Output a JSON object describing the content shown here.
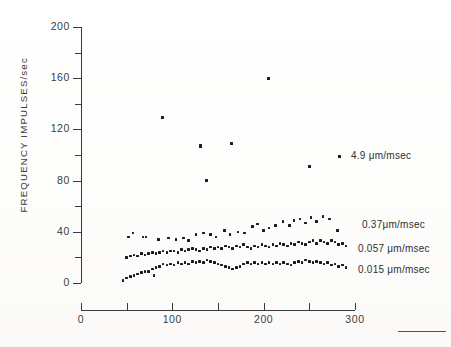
{
  "axes": {
    "y": {
      "title": "FREQUENCY  IMPULSES/sec",
      "labels": [
        "200",
        "160",
        "120",
        "80",
        "40",
        "0"
      ],
      "label_values": [
        200,
        160,
        120,
        80,
        40,
        0
      ],
      "tick_values": [
        0,
        20,
        40,
        60,
        80,
        100,
        120,
        140,
        160,
        180,
        200
      ],
      "range": [
        0,
        200
      ]
    },
    "x": {
      "title": "",
      "labels": [
        "0",
        "100",
        "200",
        "300"
      ],
      "label_values": [
        0,
        100,
        200,
        300
      ],
      "tick_values": [
        0,
        50,
        100,
        150,
        200,
        250,
        300
      ],
      "range": [
        0,
        300
      ]
    }
  },
  "legend": [
    {
      "label": "4.9 μm/msec",
      "marker": true
    },
    {
      "label": "0.37μm/msec",
      "marker": false
    },
    {
      "label": "0.057 μm/msec",
      "marker": false
    },
    {
      "label": "0.015 μm/msec",
      "marker": false
    }
  ],
  "chart_data": {
    "type": "scatter",
    "title": "",
    "xlabel": "",
    "ylabel": "FREQUENCY IMPULSES/sec",
    "xlim": [
      0,
      300
    ],
    "ylim": [
      0,
      200
    ],
    "grid": false,
    "legend_position": "right",
    "marker_color": "#1a1a1a",
    "series": [
      {
        "name": "4.9 μm/msec",
        "points": [
          [
            89,
            129
          ],
          [
            131,
            107
          ],
          [
            137,
            80
          ],
          [
            165,
            109
          ],
          [
            205,
            160
          ],
          [
            250,
            91
          ]
        ]
      },
      {
        "name": "0.37 μm/msec",
        "points": [
          [
            52,
            36
          ],
          [
            57,
            39
          ],
          [
            68,
            36
          ],
          [
            71,
            36
          ],
          [
            85,
            34
          ],
          [
            96,
            35
          ],
          [
            104,
            34
          ],
          [
            112,
            35
          ],
          [
            118,
            33
          ],
          [
            126,
            38
          ],
          [
            134,
            39
          ],
          [
            142,
            38
          ],
          [
            148,
            36
          ],
          [
            157,
            41
          ],
          [
            163,
            38
          ],
          [
            172,
            40
          ],
          [
            179,
            39
          ],
          [
            188,
            44
          ],
          [
            193,
            46
          ],
          [
            200,
            41
          ],
          [
            206,
            43
          ],
          [
            213,
            45
          ],
          [
            221,
            48
          ],
          [
            228,
            45
          ],
          [
            233,
            49
          ],
          [
            240,
            50
          ],
          [
            246,
            47
          ],
          [
            252,
            51
          ],
          [
            258,
            48
          ],
          [
            265,
            52
          ],
          [
            272,
            50
          ],
          [
            281,
            41
          ]
        ]
      },
      {
        "name": "0.057 μm/msec",
        "points": [
          [
            50,
            20
          ],
          [
            54,
            21
          ],
          [
            58,
            22
          ],
          [
            62,
            21
          ],
          [
            66,
            23
          ],
          [
            70,
            22
          ],
          [
            74,
            23
          ],
          [
            78,
            24
          ],
          [
            82,
            23
          ],
          [
            86,
            24
          ],
          [
            90,
            25
          ],
          [
            94,
            24
          ],
          [
            98,
            25
          ],
          [
            102,
            25
          ],
          [
            106,
            24
          ],
          [
            110,
            26
          ],
          [
            114,
            25
          ],
          [
            118,
            26
          ],
          [
            122,
            27
          ],
          [
            126,
            26
          ],
          [
            130,
            25
          ],
          [
            134,
            27
          ],
          [
            138,
            26
          ],
          [
            142,
            28
          ],
          [
            146,
            27
          ],
          [
            150,
            28
          ],
          [
            154,
            27
          ],
          [
            158,
            29
          ],
          [
            162,
            28
          ],
          [
            166,
            27
          ],
          [
            170,
            29
          ],
          [
            174,
            28
          ],
          [
            178,
            30
          ],
          [
            182,
            28
          ],
          [
            186,
            27
          ],
          [
            190,
            29
          ],
          [
            194,
            28
          ],
          [
            198,
            30
          ],
          [
            202,
            29
          ],
          [
            206,
            28
          ],
          [
            210,
            30
          ],
          [
            214,
            29
          ],
          [
            218,
            31
          ],
          [
            222,
            30
          ],
          [
            226,
            29
          ],
          [
            230,
            31
          ],
          [
            234,
            30
          ],
          [
            238,
            32
          ],
          [
            242,
            31
          ],
          [
            246,
            30
          ],
          [
            250,
            32
          ],
          [
            254,
            33
          ],
          [
            258,
            31
          ],
          [
            262,
            33
          ],
          [
            266,
            32
          ],
          [
            270,
            31
          ],
          [
            274,
            33
          ],
          [
            278,
            32
          ],
          [
            282,
            30
          ],
          [
            286,
            31
          ],
          [
            290,
            29
          ]
        ]
      },
      {
        "name": "0.015 μm/msec",
        "points": [
          [
            46,
            2
          ],
          [
            50,
            4
          ],
          [
            54,
            5
          ],
          [
            58,
            6
          ],
          [
            62,
            7
          ],
          [
            66,
            8
          ],
          [
            70,
            9
          ],
          [
            74,
            9
          ],
          [
            78,
            11
          ],
          [
            80,
            6
          ],
          [
            82,
            12
          ],
          [
            86,
            13
          ],
          [
            90,
            15
          ],
          [
            94,
            14
          ],
          [
            98,
            15
          ],
          [
            102,
            14
          ],
          [
            106,
            16
          ],
          [
            110,
            15
          ],
          [
            114,
            16
          ],
          [
            118,
            15
          ],
          [
            122,
            17
          ],
          [
            126,
            16
          ],
          [
            130,
            17
          ],
          [
            134,
            16
          ],
          [
            138,
            18
          ],
          [
            142,
            17
          ],
          [
            146,
            16
          ],
          [
            150,
            15
          ],
          [
            154,
            14
          ],
          [
            158,
            13
          ],
          [
            162,
            12
          ],
          [
            166,
            11
          ],
          [
            170,
            12
          ],
          [
            174,
            13
          ],
          [
            178,
            15
          ],
          [
            182,
            16
          ],
          [
            186,
            15
          ],
          [
            190,
            16
          ],
          [
            194,
            15
          ],
          [
            198,
            16
          ],
          [
            202,
            15
          ],
          [
            206,
            16
          ],
          [
            210,
            15
          ],
          [
            214,
            16
          ],
          [
            218,
            15
          ],
          [
            222,
            16
          ],
          [
            226,
            15
          ],
          [
            230,
            14
          ],
          [
            234,
            16
          ],
          [
            238,
            17
          ],
          [
            242,
            16
          ],
          [
            246,
            18
          ],
          [
            250,
            17
          ],
          [
            254,
            16
          ],
          [
            258,
            17
          ],
          [
            262,
            16
          ],
          [
            266,
            15
          ],
          [
            270,
            16
          ],
          [
            274,
            14
          ],
          [
            278,
            15
          ],
          [
            282,
            13
          ],
          [
            286,
            14
          ],
          [
            290,
            12
          ]
        ]
      }
    ]
  }
}
